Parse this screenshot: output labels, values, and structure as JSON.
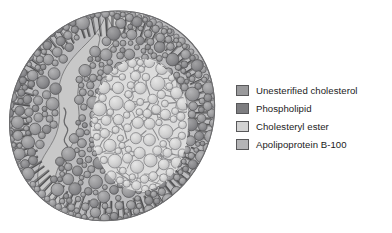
{
  "figure": {
    "background_color": "#ffffff"
  },
  "diagram": {
    "name": "ldl-particle",
    "outline_color": "#6e6e70",
    "components": [
      {
        "name": "unesterified-cholesterol",
        "label": "Unesterified cholesterol",
        "color": "#9a9a9c",
        "stroke": "#58585a",
        "role": "shell spheres"
      },
      {
        "name": "phospholipid",
        "label": "Phospholipid",
        "color": "#7d7d80",
        "stroke": "#4a4a4c",
        "role": "outer monolayer rods"
      },
      {
        "name": "cholesteryl-ester",
        "label": "Cholesteryl ester",
        "color": "#d2d2d2",
        "stroke": "#848486",
        "role": "core spheres"
      },
      {
        "name": "apolipoprotein-b-100",
        "label": "Apolipoprotein B-100",
        "color": "#c2c2c2",
        "stroke": "#7a7a7c",
        "role": "surface protein band"
      }
    ]
  },
  "legend": {
    "name": "component-legend",
    "items": [
      {
        "label": "Unesterified cholesterol",
        "color": "#9a9a9c"
      },
      {
        "label": "Phospholipid",
        "color": "#7d7d80"
      },
      {
        "label": "Cholesteryl ester",
        "color": "#d2d2d2"
      },
      {
        "label": "Apolipoprotein B-100",
        "color": "#b4b4b6"
      }
    ]
  }
}
